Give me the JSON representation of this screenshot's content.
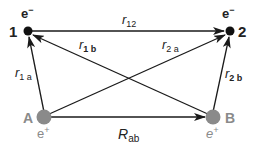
{
  "diagram": {
    "colors": {
      "electron": "#111111",
      "positron": "#8a8a8a",
      "line": "#1a1a1a",
      "label": "#222222",
      "positron_label": "#8a8a8a"
    },
    "nodes": {
      "electron1": {
        "number": "1",
        "charge": "e",
        "charge_sup": "−"
      },
      "electron2": {
        "number": "2",
        "charge": "e",
        "charge_sup": "−"
      },
      "positronA": {
        "letter": "A",
        "charge": "e",
        "charge_sup": "+"
      },
      "positronB": {
        "letter": "B",
        "charge": "e",
        "charge_sup": "+"
      }
    },
    "edges": {
      "r12": {
        "main": "r",
        "sub": "12"
      },
      "r1b": {
        "main": "r",
        "sub": "1 b"
      },
      "r2a": {
        "main": "r",
        "sub": "2 a"
      },
      "r1a": {
        "main": "r",
        "sub": "1 a"
      },
      "r2b": {
        "main": "r",
        "sub": "2 b"
      },
      "Rab": {
        "main": "R",
        "sub": "ab"
      }
    }
  }
}
